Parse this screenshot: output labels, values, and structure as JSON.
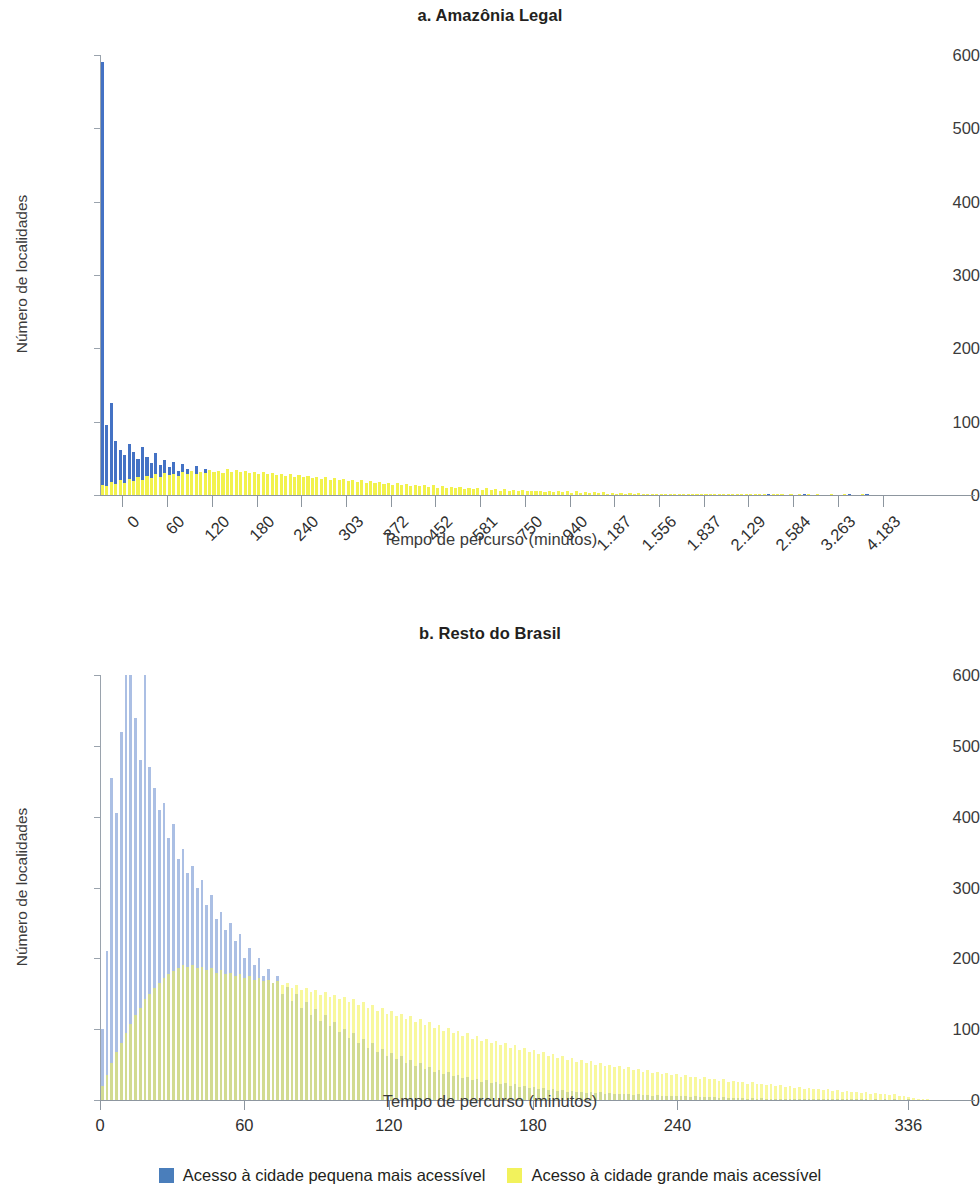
{
  "figure": {
    "legend": {
      "position": "bottom-center",
      "items": [
        {
          "label": "Acesso à cidade pequena mais acessível",
          "color": "#4a7ebb",
          "key": "small_city"
        },
        {
          "label": "Acesso à cidade grande mais acessível",
          "color": "#f2f25c",
          "key": "large_city"
        }
      ]
    }
  },
  "chart_data": [
    {
      "id": "a",
      "type": "bar",
      "title": "a. Amazônia Legal",
      "xlabel": "Tempo de percurso (minutos)",
      "ylabel": "Número de localidades",
      "ylim": [
        0,
        600
      ],
      "yticks": [
        0,
        100,
        200,
        300,
        400,
        500,
        600
      ],
      "grid": false,
      "xtick_labels": [
        "0",
        "60",
        "120",
        "180",
        "240",
        "303",
        "372",
        "452",
        "581",
        "750",
        "940",
        "1.187",
        "1.556",
        "1.837",
        "2.129",
        "2.584",
        "3.263",
        "4.183"
      ],
      "xtick_rotated": true,
      "n_bins": 180,
      "series": [
        {
          "name": "Acesso à cidade pequena mais acessível",
          "color": "#4472c4",
          "values": [
            590,
            96,
            125,
            74,
            62,
            55,
            70,
            58,
            49,
            66,
            52,
            44,
            57,
            41,
            48,
            38,
            45,
            33,
            42,
            36,
            30,
            40,
            28,
            35,
            26,
            32,
            24,
            30,
            22,
            27,
            20,
            25,
            18,
            23,
            16,
            21,
            15,
            19,
            14,
            17,
            13,
            16,
            12,
            15,
            11,
            14,
            10,
            13,
            9,
            12,
            8,
            11,
            8,
            10,
            7,
            10,
            6,
            9,
            6,
            8,
            5,
            8,
            5,
            7,
            4,
            7,
            4,
            6,
            4,
            6,
            3,
            5,
            3,
            5,
            3,
            4,
            3,
            4,
            2,
            4,
            2,
            3,
            2,
            3,
            2,
            3,
            2,
            3,
            1,
            2,
            1,
            2,
            1,
            2,
            1,
            2,
            1,
            2,
            1,
            2,
            1,
            1,
            1,
            2,
            1,
            1,
            1,
            2,
            1,
            1,
            1,
            1,
            1,
            2,
            1,
            1,
            1,
            1,
            1,
            1,
            1,
            2,
            1,
            1,
            1,
            1,
            0,
            1,
            1,
            1,
            0,
            1,
            1,
            1,
            0,
            1,
            0,
            1,
            1,
            1,
            0,
            1,
            0,
            1,
            0,
            1,
            0,
            1,
            0,
            1,
            0,
            0,
            1,
            0,
            1,
            0,
            0,
            1,
            0,
            0,
            1,
            0,
            0,
            1,
            0,
            0,
            0,
            1,
            0,
            0,
            0,
            1,
            0,
            0,
            0,
            0,
            0,
            0
          ]
        },
        {
          "name": "Acesso à cidade grande mais acessível",
          "color": "#f2f24d",
          "values": [
            14,
            12,
            18,
            15,
            20,
            17,
            22,
            19,
            24,
            21,
            26,
            23,
            28,
            25,
            30,
            27,
            29,
            26,
            31,
            28,
            33,
            29,
            32,
            30,
            34,
            31,
            33,
            30,
            35,
            32,
            34,
            31,
            33,
            30,
            32,
            29,
            31,
            28,
            30,
            27,
            29,
            26,
            28,
            25,
            27,
            24,
            26,
            23,
            25,
            22,
            24,
            21,
            23,
            20,
            22,
            19,
            21,
            18,
            20,
            17,
            19,
            16,
            18,
            15,
            17,
            14,
            16,
            13,
            15,
            12,
            14,
            12,
            13,
            11,
            13,
            10,
            12,
            10,
            11,
            9,
            11,
            8,
            10,
            8,
            9,
            7,
            9,
            7,
            8,
            6,
            8,
            6,
            7,
            5,
            7,
            5,
            6,
            5,
            6,
            4,
            6,
            4,
            5,
            4,
            5,
            3,
            5,
            3,
            4,
            3,
            4,
            3,
            4,
            2,
            3,
            2,
            3,
            2,
            3,
            2,
            3,
            2,
            2,
            2,
            2,
            1,
            2,
            1,
            2,
            1,
            2,
            1,
            2,
            1,
            1,
            1,
            1,
            1,
            1,
            1,
            1,
            1,
            1,
            1,
            1,
            1,
            1,
            1,
            1,
            0,
            1,
            1,
            1,
            0,
            1,
            0,
            1,
            0,
            1,
            0,
            1,
            0,
            0,
            1,
            0,
            0,
            1,
            0,
            0,
            0,
            1,
            0,
            0,
            0,
            0,
            0,
            0,
            0
          ]
        }
      ]
    },
    {
      "id": "b",
      "type": "bar",
      "title": "b. Resto do Brasil",
      "xlabel": "Tempo de percurso (minutos)",
      "ylabel": "Número de localidades",
      "ylim": [
        0,
        600
      ],
      "yticks": [
        0,
        100,
        200,
        300,
        400,
        500,
        600
      ],
      "grid": false,
      "xtick_labels": [
        "0",
        "60",
        "120",
        "180",
        "240",
        "336"
      ],
      "xtick_values": [
        0,
        60,
        120,
        180,
        240,
        336
      ],
      "xtick_rotated": false,
      "xlim": [
        0,
        345
      ],
      "n_bins": 175,
      "series": [
        {
          "name": "Acesso à cidade pequena mais acessível",
          "color": "#4472c4",
          "opacity": 0.45,
          "values": [
            100,
            210,
            455,
            405,
            520,
            600,
            600,
            540,
            480,
            600,
            470,
            440,
            410,
            420,
            370,
            390,
            340,
            355,
            320,
            330,
            300,
            310,
            275,
            290,
            255,
            265,
            240,
            250,
            225,
            235,
            200,
            215,
            190,
            200,
            175,
            185,
            165,
            175,
            150,
            160,
            140,
            150,
            130,
            138,
            120,
            128,
            112,
            120,
            104,
            110,
            96,
            100,
            88,
            94,
            80,
            86,
            74,
            80,
            68,
            72,
            62,
            66,
            58,
            62,
            52,
            56,
            48,
            52,
            44,
            47,
            40,
            43,
            37,
            40,
            34,
            36,
            31,
            33,
            28,
            30,
            26,
            28,
            24,
            26,
            22,
            24,
            20,
            22,
            18,
            20,
            17,
            18,
            16,
            17,
            14,
            16,
            13,
            14,
            12,
            13,
            11,
            12,
            10,
            11,
            10,
            11,
            9,
            10,
            8,
            9,
            8,
            9,
            7,
            8,
            7,
            7,
            6,
            7,
            6,
            6,
            5,
            6,
            5,
            5,
            4,
            5,
            4,
            4,
            4,
            4,
            3,
            4,
            3,
            3,
            3,
            3,
            2,
            3,
            2,
            3,
            2,
            2,
            2,
            2,
            2,
            2,
            1,
            2,
            1,
            2,
            1,
            1,
            1,
            1,
            1,
            1,
            1,
            1,
            1,
            1,
            1,
            1,
            0,
            1,
            0,
            1,
            0,
            1,
            0,
            0,
            1,
            0,
            0,
            0,
            0,
            0,
            0
          ]
        },
        {
          "name": "Acesso à cidade grande mais acessível",
          "color": "#f2f24d",
          "opacity": 0.55,
          "values": [
            20,
            35,
            52,
            68,
            80,
            95,
            108,
            120,
            130,
            142,
            150,
            158,
            165,
            172,
            178,
            182,
            186,
            190,
            188,
            190,
            186,
            188,
            184,
            186,
            180,
            184,
            178,
            180,
            175,
            178,
            172,
            175,
            170,
            172,
            168,
            170,
            165,
            168,
            162,
            165,
            158,
            162,
            155,
            158,
            152,
            155,
            148,
            152,
            145,
            148,
            142,
            145,
            138,
            142,
            134,
            138,
            130,
            134,
            126,
            130,
            122,
            126,
            118,
            122,
            114,
            118,
            110,
            114,
            106,
            110,
            102,
            106,
            98,
            102,
            94,
            98,
            90,
            94,
            86,
            90,
            83,
            86,
            80,
            83,
            77,
            80,
            74,
            77,
            71,
            74,
            68,
            71,
            65,
            68,
            62,
            65,
            60,
            62,
            57,
            60,
            54,
            57,
            52,
            55,
            50,
            52,
            48,
            50,
            46,
            48,
            44,
            46,
            42,
            44,
            40,
            42,
            38,
            40,
            37,
            38,
            35,
            37,
            33,
            35,
            32,
            33,
            30,
            32,
            29,
            30,
            27,
            29,
            26,
            27,
            25,
            26,
            23,
            25,
            22,
            23,
            21,
            22,
            20,
            21,
            18,
            20,
            17,
            18,
            16,
            17,
            15,
            16,
            14,
            15,
            13,
            14,
            12,
            13,
            11,
            12,
            10,
            11,
            9,
            10,
            8,
            9,
            7,
            8,
            6,
            5,
            4,
            3,
            2,
            1,
            1
          ]
        }
      ]
    }
  ]
}
